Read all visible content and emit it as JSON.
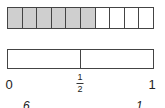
{
  "diagram": {
    "tenths_bar": {
      "total_parts": 10,
      "shaded_parts": 6,
      "shaded_color": "#cfcfcf",
      "unshaded_color": "#ffffff",
      "border_color": "#444444"
    },
    "halves_bar": {
      "total_parts": 2,
      "border_color": "#444444"
    },
    "number_line_labels": {
      "zero": "0",
      "half_numerator": "1",
      "half_denominator": "2",
      "one": "1"
    },
    "partial_bottom_text": {
      "left": "6",
      "right": "1"
    }
  }
}
